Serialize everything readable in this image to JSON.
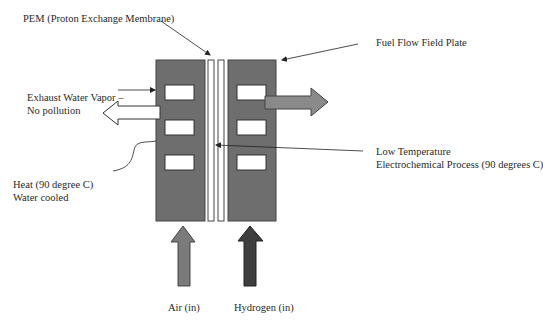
{
  "diagram": {
    "type": "PEM fuel cell schematic",
    "colors": {
      "plate": "#6e6e6e",
      "slot": "#ffffff",
      "membrane": "#ffffff",
      "air_arrow": "#7a7a7a",
      "hydrogen_arrow": "#3e3e3e",
      "fuel_arrow": "#8a8a8a",
      "exhaust_arrow": "#ffffff",
      "line": "#222222"
    },
    "labels": {
      "pem": "PEM (Proton Exchange Membrane)",
      "fuel_flow_plate": "Fuel Flow Field Plate",
      "exhaust_line1": "Exhaust Water Vapor –",
      "exhaust_line2": "No pollution",
      "fuel_recirculate": "Fuel to Recirculate",
      "low_temp_line1": "Low Temperature",
      "low_temp_line2": "Electrochemical Process (90 degrees C)",
      "heat_line1": "Heat (90 degree C)",
      "heat_line2": "Water cooled",
      "air_in": "Air (in)",
      "hydrogen_in": "Hydrogen (in)"
    }
  }
}
